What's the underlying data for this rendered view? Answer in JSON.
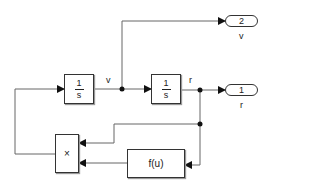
{
  "diagram": {
    "blocks": {
      "integrator1": {
        "num": "1",
        "den": "s"
      },
      "integrator2": {
        "num": "1",
        "den": "s"
      },
      "product": {
        "label": "×"
      },
      "fcn": {
        "label": "f(u)"
      },
      "outport1": {
        "number": "1",
        "name": "r"
      },
      "outport2": {
        "number": "2",
        "name": "v"
      }
    },
    "signals": {
      "v": "v",
      "r": "r"
    },
    "colors": {
      "line": "#555555",
      "block_border": "#333333"
    }
  }
}
